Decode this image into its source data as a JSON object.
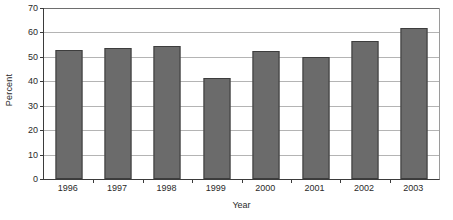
{
  "chart_data": {
    "type": "bar",
    "title": "",
    "subtitle": "",
    "xlabel": "Year",
    "ylabel": "Percent",
    "categories": [
      "1996",
      "1997",
      "1998",
      "1999",
      "2000",
      "2001",
      "2002",
      "2003"
    ],
    "values": [
      52.8,
      53.7,
      54.4,
      41.2,
      52.3,
      50.1,
      56.7,
      62.0
    ],
    "series": [
      {
        "name": "Percent",
        "values": [
          52.8,
          53.7,
          54.4,
          41.2,
          52.3,
          50.1,
          56.7,
          62.0
        ]
      }
    ],
    "ylim": [
      0,
      70
    ],
    "ytick_values": [
      0,
      10,
      20,
      30,
      40,
      50,
      60,
      70
    ],
    "ytick_labels": [
      "0",
      "10",
      "20",
      "30",
      "40",
      "50",
      "60",
      "70"
    ],
    "grid": true,
    "grid_axis": "y",
    "legend": false,
    "legend_position": "none",
    "bar_color": "#6b6b6b",
    "bar_border_color": "#3d3d3d",
    "gridline_color": "#b4b4b4",
    "axis_color": "#3b3b3b",
    "background_color": "#ffffff",
    "annotations": []
  }
}
